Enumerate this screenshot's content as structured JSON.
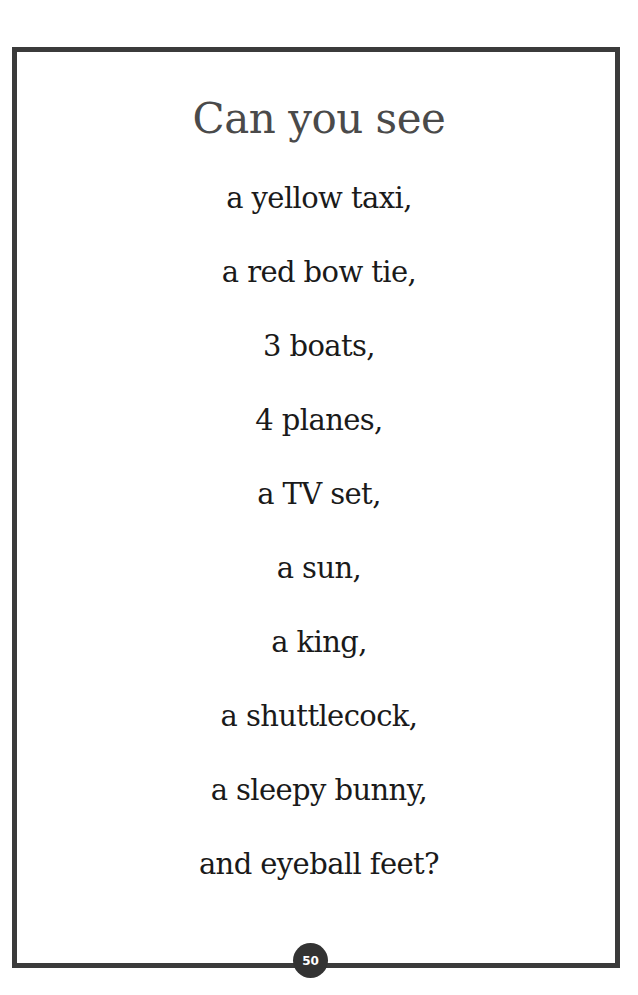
{
  "page": {
    "title": "Can you see",
    "lines": [
      "a yellow taxi,",
      "a red bow tie,",
      "3 boats,",
      "4 planes,",
      "a TV set,",
      "a sun,",
      "a king,",
      "a shuttlecock,",
      "a sleepy bunny,",
      "and eyeball feet?"
    ],
    "page_number": "50",
    "colors": {
      "border": "#3b3b3b",
      "title": "#4a4a4a",
      "text": "#1a1a1a",
      "badge": "#333333"
    }
  }
}
